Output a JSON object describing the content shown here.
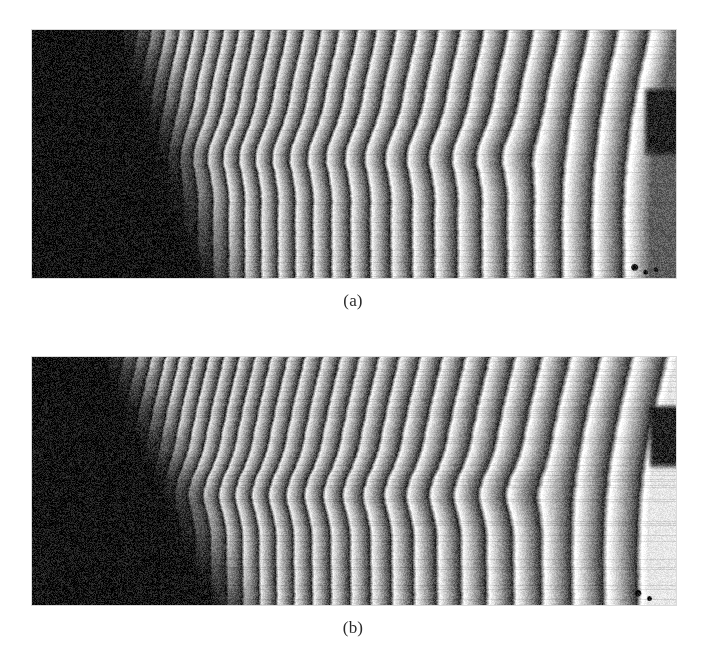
{
  "figure": {
    "background_color": "#ffffff",
    "width": 706,
    "height": 664,
    "kind": "two-panel grayscale micrograph figure",
    "panels": [
      {
        "id": "panel-a",
        "caption": "(a)",
        "frame": {
          "x": 32,
          "y": 30,
          "width": 644,
          "height": 248
        },
        "caption_y": 292,
        "description": "Grayscale scanning micrograph: dark wedge at left, ~28 bright curved interference fringes fanning out to the right, a horizontal dislocation kink band near mid-height, and a broken fringe defect at the right edge.",
        "image": {
          "type": "fringe-field",
          "background_dark": "#121212",
          "fringe_bright": "#f2f2f2",
          "fringe_dark": "#2a2a2a",
          "noise_amount": 0.3,
          "fringe_count": 28,
          "dark_wedge": {
            "top_x_fraction": 0.175,
            "bottom_x_fraction": 0.3,
            "softness": 0.055
          },
          "spacing": {
            "left_period_px": 13,
            "right_period_px": 34,
            "growth": 1.9
          },
          "kink_band": {
            "center_y_fraction": 0.5,
            "height_fraction": 0.17,
            "amplitude_px": 9,
            "start_x_fraction": 0.22,
            "end_x_fraction": 0.78
          },
          "curvature": {
            "lean_px": 26,
            "bow_px": 16
          },
          "right_defect": {
            "x_fraction": 0.955,
            "y_fraction": 0.22,
            "width_fraction": 0.05,
            "height_fraction": 0.3
          },
          "bottom_right_blobs": [
            {
              "x_fraction": 0.935,
              "y_fraction": 0.955,
              "r": 3
            },
            {
              "x_fraction": 0.952,
              "y_fraction": 0.975,
              "r": 2
            },
            {
              "x_fraction": 0.968,
              "y_fraction": 0.965,
              "r": 2
            }
          ],
          "seed": 1701
        }
      },
      {
        "id": "panel-b",
        "caption": "(b)",
        "frame": {
          "x": 32,
          "y": 357,
          "width": 644,
          "height": 248
        },
        "caption_y": 619,
        "description": "Second grayscale scanning micrograph of the same grating: same dark left wedge and fringe family, but the dislocation kink band sits slightly lower and a short broken fringe segment appears left of centre.",
        "image": {
          "type": "fringe-field",
          "background_dark": "#131313",
          "fringe_bright": "#f0f0f0",
          "fringe_dark": "#2b2b2b",
          "noise_amount": 0.3,
          "fringe_count": 28,
          "dark_wedge": {
            "top_x_fraction": 0.15,
            "bottom_x_fraction": 0.32,
            "softness": 0.055
          },
          "spacing": {
            "left_period_px": 13,
            "right_period_px": 36,
            "growth": 1.95
          },
          "kink_band": {
            "center_y_fraction": 0.545,
            "height_fraction": 0.17,
            "amplitude_px": 10,
            "start_x_fraction": 0.2,
            "end_x_fraction": 0.8
          },
          "curvature": {
            "lean_px": 28,
            "bow_px": 18
          },
          "right_defect": {
            "x_fraction": 0.962,
            "y_fraction": 0.18,
            "width_fraction": 0.05,
            "height_fraction": 0.28
          },
          "bottom_right_blobs": [
            {
              "x_fraction": 0.94,
              "y_fraction": 0.95,
              "r": 3
            },
            {
              "x_fraction": 0.958,
              "y_fraction": 0.972,
              "r": 2
            }
          ],
          "seed": 2904
        }
      }
    ]
  }
}
